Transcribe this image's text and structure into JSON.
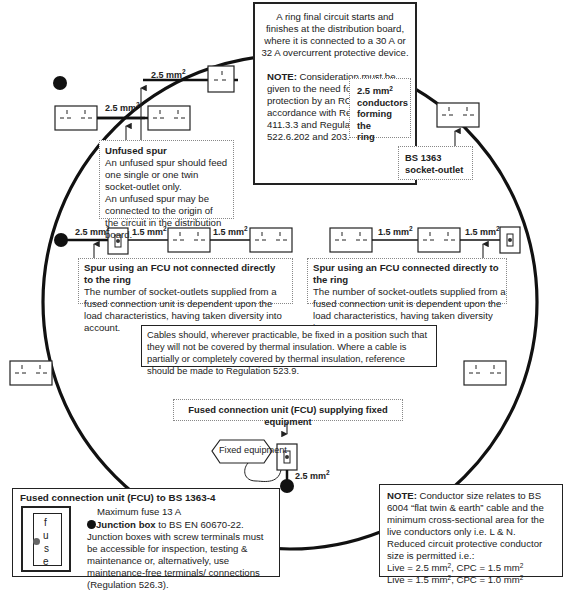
{
  "ring_circuit": {
    "description": "A ring final circuit starts and finishes at the distribution board, where it is connected to a 30 A or 32 A overcurrent protective device.",
    "note_label": "NOTE:",
    "note_text": " Consideration must be given to the need for additional protection by an RCD in accordance with Regulation 411.3.3 and Regulations 522.6.202 and 203."
  },
  "ring_conductors": {
    "label": "2.5 mm² conductors forming the ring",
    "line1": "2.5 mm",
    "sup": "2",
    "line2": "conductors",
    "line3": "forming the",
    "line4": "ring"
  },
  "socket_outlet": {
    "line1": "BS 1363",
    "line2": "socket-outlet"
  },
  "unfused_spur": {
    "title": "Unfused spur",
    "text1": "An unfused spur should feed one single or one twin socket-outlet only.",
    "text2": "An unfused spur may be connected to the origin of the circuit in the distribution board."
  },
  "spur_fcu_left": {
    "title": "Spur using an FCU not connected directly to the ring",
    "text": "The number of socket-outlets supplied from a fused connection unit is dependent upon the load characteristics, having taken diversity into account."
  },
  "spur_fcu_right": {
    "title": "Spur using an FCU connected directly to the ring",
    "text": "The number of socket-outlets supplied from a fused connection unit is dependent upon the load characteristics, having taken diversity into account."
  },
  "thermal_note": {
    "text": "Cables should, wherever practicable, be fixed in a position such that they will not be covered by thermal insulation. Where a cable is partially or completely covered by thermal insulation, reference should be made to Regulation 523.9."
  },
  "fcu_fixed": {
    "title": "Fused connection unit (FCU) supplying fixed equipment",
    "fixed_equipment": "Fixed equipment"
  },
  "cable_labels": {
    "top_spur_upper": "2.5 mm",
    "top_spur_lower": "2.5 mm",
    "left_ring_to_fcu": "2.5 mm",
    "left_fcu_to_socket": "1.5 mm",
    "left_socket_to_socket": "1.5 mm",
    "right_socket_to_socket": "1.5 mm",
    "right_socket_to_fcu": "1.5 mm",
    "bottom_fcu": "2.5 mm",
    "sup": "2"
  },
  "legend": {
    "title": "Fused connection unit (FCU) to BS 1363-4",
    "max_fuse": "Maximum fuse 13 A",
    "fuse_letters": [
      "f",
      "u",
      "s",
      "e"
    ],
    "junction_bold": "Junction box",
    "junction_rest": " to BS EN 60670-22.",
    "junction_text": "Junction boxes with screw terminals must be accessible for inspection, testing & maintenance or, alternatively, use maintenance-free terminals/ connections (Regulation 526.3)."
  },
  "conductor_note": {
    "label": "NOTE:",
    "text": " Conductor size relates to BS 6004 “flat twin & earth” cable and the minimum cross-sectional area for the live conductors only i.e. L & N.",
    "reduced": "Reduced circuit protective conductor size is permitted i.e.:",
    "line1_a": "Live = 2.5 mm",
    "line1_b": ", CPC = 1.5 mm",
    "line2_a": "Live = 1.5 mm",
    "line2_b": ", CPC = 1.0 mm",
    "sup": "2"
  },
  "colors": {
    "line": "#111111",
    "dotted_border": "#888888",
    "fuse_dot": "#666666"
  }
}
